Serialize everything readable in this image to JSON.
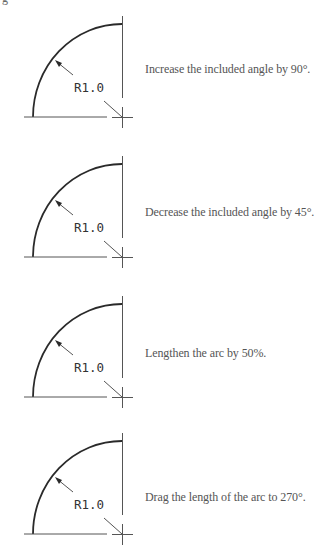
{
  "page": {
    "corner_fragment": "g"
  },
  "figures": [
    {
      "id": 1,
      "offset_y": 0,
      "dimension_label": "R1.0",
      "caption": "Increase the included angle by 90°.",
      "caption_top": 62
    },
    {
      "id": 2,
      "offset_y": 140,
      "dimension_label": "R1.0",
      "caption": "Decrease the included angle by 45°.",
      "caption_top": 65
    },
    {
      "id": 3,
      "offset_y": 280,
      "dimension_label": "R1.0",
      "caption": "Lengthen the arc by 50%.",
      "caption_top": 66
    },
    {
      "id": 4,
      "offset_y": 417,
      "dimension_label": "R1.0",
      "caption": "Drag the length of the arc to 270°.",
      "caption_top": 73
    }
  ],
  "colors": {
    "line": "#2a2a2a",
    "caption_text": "#555555",
    "background": "#ffffff"
  }
}
